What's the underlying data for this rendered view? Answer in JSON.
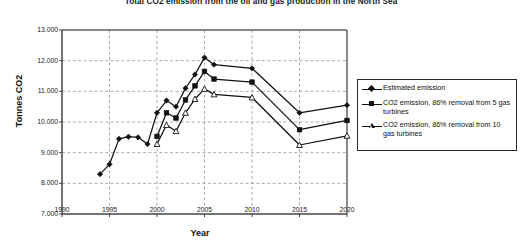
{
  "chart_data": {
    "type": "line",
    "title": "Total CO2 emission from the oil and gas production in the North Sea",
    "xlabel": "Year",
    "ylabel": "Tonnes CO2",
    "xlim": [
      1990,
      2020
    ],
    "ylim": [
      7000,
      13000
    ],
    "xticks": [
      "1990",
      "1995",
      "2000",
      "2005",
      "2010",
      "2015",
      "2020"
    ],
    "yticks": [
      "7.000",
      "8.000",
      "9.000",
      "10.000",
      "11.000",
      "12.000",
      "13.000"
    ],
    "grid": "dashed both axes",
    "legend_position": "right",
    "series": [
      {
        "name": "Estimated emission",
        "marker": "filled-diamond",
        "color": "#111111",
        "x": [
          1994,
          1995,
          1996,
          1997,
          1998,
          1999,
          2000,
          2001,
          2002,
          2003,
          2004,
          2005,
          2006,
          2010,
          2015,
          2020
        ],
        "values": [
          8300,
          8620,
          9450,
          9520,
          9500,
          9280,
          10300,
          10700,
          10500,
          11100,
          11550,
          12100,
          11870,
          11750,
          10300,
          10550
        ]
      },
      {
        "name": "CO2 emission, 86% removal from 5 gas turbines",
        "marker": "filled-square",
        "color": "#111111",
        "x": [
          2000,
          2001,
          2002,
          2003,
          2004,
          2005,
          2006,
          2010,
          2015,
          2020
        ],
        "values": [
          9530,
          10300,
          10130,
          10720,
          11180,
          11650,
          11400,
          11300,
          9750,
          10050
        ]
      },
      {
        "name": "CO2 emission, 86% removal from 10 gas turbines",
        "marker": "open-triangle",
        "color": "#111111",
        "x": [
          2000,
          2001,
          2002,
          2003,
          2004,
          2005,
          2006,
          2010,
          2015,
          2020
        ],
        "values": [
          9280,
          9900,
          9700,
          10300,
          10750,
          11080,
          10900,
          10800,
          9250,
          9550
        ]
      }
    ]
  },
  "legend": {
    "items": [
      {
        "label": "Estimated emission",
        "marker": "filled-diamond"
      },
      {
        "label": "CO2 emission, 86% removal from 5 gas turbines",
        "marker": "filled-square"
      },
      {
        "label": "CO2 emission, 86% removal from 10 gas turbines",
        "marker": "open-triangle"
      }
    ]
  }
}
